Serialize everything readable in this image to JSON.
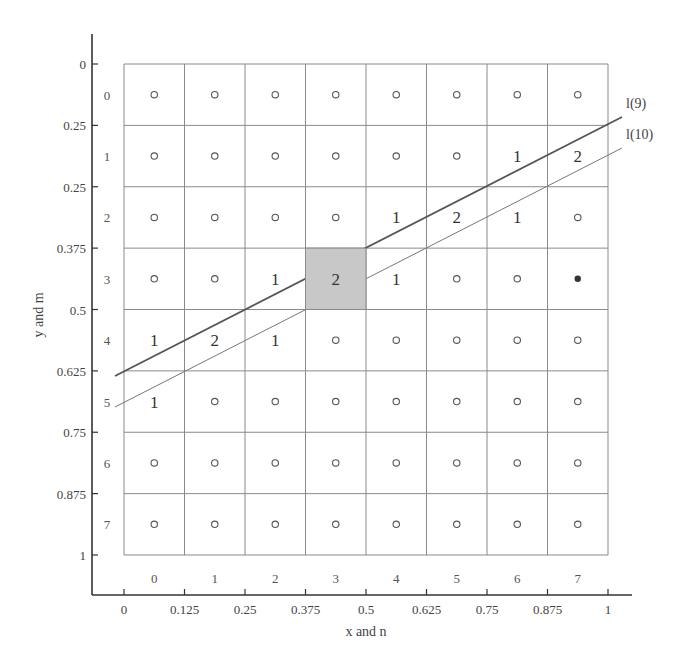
{
  "figure": {
    "type": "grid-diagram",
    "x_axis_label": "x and n",
    "y_axis_label": "y and m",
    "x_ticks": [
      "0",
      "0.125",
      "0.25",
      "0.375",
      "0.5",
      "0.625",
      "0.75",
      "0.875",
      "1"
    ],
    "y_ticks": [
      "0",
      "0.25",
      "0.25",
      "0.375",
      "0.5",
      "0.625",
      "0.75",
      "0.875",
      "1"
    ],
    "column_indices": [
      "0",
      "1",
      "2",
      "3",
      "4",
      "5",
      "6",
      "7"
    ],
    "row_indices": [
      "0",
      "1",
      "2",
      "3",
      "4",
      "5",
      "6",
      "7"
    ],
    "grid_size": 8,
    "cells": [
      [
        "o",
        "o",
        "o",
        "o",
        "o",
        "o",
        "o",
        "o"
      ],
      [
        "o",
        "o",
        "o",
        "o",
        "o",
        "o",
        "1",
        "2"
      ],
      [
        "o",
        "o",
        "o",
        "o",
        "1",
        "2",
        "1",
        "o"
      ],
      [
        "o",
        "o",
        "1",
        "2",
        "1",
        "o",
        "o",
        "*"
      ],
      [
        "1",
        "2",
        "1",
        "o",
        "o",
        "o",
        "o",
        "o"
      ],
      [
        "1",
        "o",
        "o",
        "o",
        "o",
        "o",
        "o",
        "o"
      ],
      [
        "o",
        "o",
        "o",
        "o",
        "o",
        "o",
        "o",
        "o"
      ],
      [
        "o",
        "o",
        "o",
        "o",
        "o",
        "o",
        "o",
        "o"
      ]
    ],
    "highlighted_cell": {
      "row": 3,
      "col": 3,
      "color": "#c8c8c8"
    },
    "filled_marker_cell": {
      "row": 3,
      "col": 7
    },
    "lines": [
      {
        "label": "l(9)",
        "weight": "thick",
        "color": "#555555"
      },
      {
        "label": "l(10)",
        "weight": "thin",
        "color": "#777777"
      }
    ],
    "colors": {
      "grid": "#8a8a8a",
      "axis": "#333333",
      "text": "#444444",
      "marker": "#555555"
    }
  }
}
